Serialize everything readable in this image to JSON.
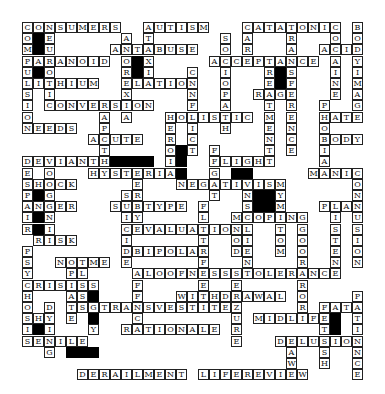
{
  "puzzle": {
    "type": "crossword",
    "cell_size": 11,
    "rows": 32,
    "cols": 31,
    "across": [
      {
        "word": "CONSUMERS",
        "row": 0,
        "col": 0
      },
      {
        "word": "AUTISM",
        "row": 0,
        "col": 11
      },
      {
        "word": "CATATONIC",
        "row": 0,
        "col": 20
      },
      {
        "word": "ANTABUSE",
        "row": 2,
        "col": 8
      },
      {
        "word": "ACID",
        "row": 2,
        "col": 27
      },
      {
        "word": "PARANOID",
        "row": 3,
        "col": 0
      },
      {
        "word": "ACCEPTANCE",
        "row": 3,
        "col": 17
      },
      {
        "word": "LITHIUM",
        "row": 5,
        "col": 0
      },
      {
        "word": "ELATION",
        "row": 5,
        "col": 9
      },
      {
        "word": "RAGE",
        "row": 6,
        "col": 21
      },
      {
        "word": "CONVERSION",
        "row": 7,
        "col": 2
      },
      {
        "word": "HOLISTIC",
        "row": 8,
        "col": 13
      },
      {
        "word": "HATE",
        "row": 8,
        "col": 27
      },
      {
        "word": "NEEDS",
        "row": 9,
        "col": 0
      },
      {
        "word": "ACUTE",
        "row": 10,
        "col": 6
      },
      {
        "word": "BODY",
        "row": 10,
        "col": 27
      },
      {
        "word": "DEVIANT",
        "row": 12,
        "col": 0
      },
      {
        "word": "FLIGHT",
        "row": 12,
        "col": 17
      },
      {
        "word": "HYSTERIA",
        "row": 13,
        "col": 6
      },
      {
        "word": "MANIC",
        "row": 13,
        "col": 26
      },
      {
        "word": "SHOCK",
        "row": 14,
        "col": 0
      },
      {
        "word": "NEGATIVISM",
        "row": 14,
        "col": 14
      },
      {
        "word": "PLAN",
        "row": 16,
        "col": 27
      },
      {
        "word": "ANGER",
        "row": 16,
        "col": 0
      },
      {
        "word": "SUBTYPE",
        "row": 16,
        "col": 8
      },
      {
        "word": "COPING",
        "row": 17,
        "col": 20
      },
      {
        "word": "EVALUATION",
        "row": 18,
        "col": 10
      },
      {
        "word": "RISK",
        "row": 19,
        "col": 1
      },
      {
        "word": "BIPOLAR",
        "row": 20,
        "col": 10
      },
      {
        "word": "NOTME",
        "row": 21,
        "col": 3
      },
      {
        "word": "ALOOFNESS",
        "row": 22,
        "col": 10
      },
      {
        "word": "TOLERANCE",
        "row": 22,
        "col": 20
      },
      {
        "word": "CRISIS",
        "row": 23,
        "col": 0
      },
      {
        "word": "WITHDRAWAL",
        "row": 24,
        "col": 14
      },
      {
        "word": "TRANSVESTITE",
        "row": 25,
        "col": 7
      },
      {
        "word": "FAT",
        "row": 25,
        "col": 27
      },
      {
        "word": "SHY",
        "row": 26,
        "col": 0
      },
      {
        "word": "MIDLIFE",
        "row": 26,
        "col": 21
      },
      {
        "word": "RATIONALE",
        "row": 27,
        "col": 9
      },
      {
        "word": "SENILE",
        "row": 28,
        "col": 0
      },
      {
        "word": "DELUSION",
        "row": 28,
        "col": 23
      },
      {
        "word": "DERAILMENT",
        "row": 31,
        "col": 5
      },
      {
        "word": "LIFEREVIEW",
        "row": 31,
        "col": 16
      }
    ],
    "down": [
      {
        "word": "COMPULSION",
        "row": 0,
        "col": 0
      },
      {
        "word": "NEUROTIC",
        "row": 0,
        "col": 2
      },
      {
        "word": "ANOREXIA",
        "row": 1,
        "col": 9
      },
      {
        "word": "ATAXIA",
        "row": 0,
        "col": 11
      },
      {
        "word": "SOCIOPATH",
        "row": 1,
        "col": 18
      },
      {
        "word": "CARE",
        "row": 0,
        "col": 20
      },
      {
        "word": "TRANSFERENCE",
        "row": 0,
        "col": 24
      },
      {
        "word": "TREATMENT",
        "row": 3,
        "col": 22
      },
      {
        "word": "COCAINE",
        "row": 0,
        "col": 28
      },
      {
        "word": "BODYIMAGE",
        "row": 0,
        "col": 30
      },
      {
        "word": "CONFLICT",
        "row": 4,
        "col": 15
      },
      {
        "word": "APATHY",
        "row": 8,
        "col": 7
      },
      {
        "word": "HEROIN",
        "row": 8,
        "col": 13
      },
      {
        "word": "PHOBIA",
        "row": 7,
        "col": 27
      },
      {
        "word": "DESPAIR",
        "row": 12,
        "col": 0
      },
      {
        "word": "ORGANIC",
        "row": 13,
        "col": 2
      },
      {
        "word": "ENERGY",
        "row": 12,
        "col": 10
      },
      {
        "word": "FIGHT",
        "row": 11,
        "col": 17
      },
      {
        "word": "GAINS",
        "row": 12,
        "col": 20
      },
      {
        "word": "SYMPTOM",
        "row": 14,
        "col": 23
      },
      {
        "word": "CONFUSION",
        "row": 13,
        "col": 30
      },
      {
        "word": "LISTEN",
        "row": 16,
        "col": 28
      },
      {
        "word": "EGO",
        "row": 17,
        "col": 25
      },
      {
        "word": "SUICIDE",
        "row": 15,
        "col": 9
      },
      {
        "word": "FLATAFFECT",
        "row": 16,
        "col": 16
      },
      {
        "word": "MOOD",
        "row": 17,
        "col": 19
      },
      {
        "word": "CLIENT",
        "row": 17,
        "col": 20
      },
      {
        "word": "SORORORO",
        "row": 19,
        "col": 25
      },
      {
        "word": "PSYCHOSIS",
        "row": 20,
        "col": 0
      },
      {
        "word": "OPIATE",
        "row": 21,
        "col": 4
      },
      {
        "word": "LOSS",
        "row": 22,
        "col": 5
      },
      {
        "word": "AFFECT",
        "row": 22,
        "col": 10
      },
      {
        "word": "SEIZURE",
        "row": 22,
        "col": 19
      },
      {
        "word": "PATIENCE",
        "row": 24,
        "col": 30
      },
      {
        "word": "DYING",
        "row": 25,
        "col": 2
      },
      {
        "word": "GAY",
        "row": 25,
        "col": 6
      },
      {
        "word": "FETISH",
        "row": 25,
        "col": 27
      },
      {
        "word": "SFEA",
        "row": 23,
        "col": 6
      },
      {
        "word": "RAW",
        "row": 28,
        "col": 24
      }
    ],
    "blocks": [
      [
        1,
        1
      ],
      [
        2,
        1
      ],
      [
        4,
        1
      ],
      [
        3,
        10
      ],
      [
        4,
        10
      ],
      [
        4,
        23
      ],
      [
        5,
        23
      ],
      [
        12,
        8
      ],
      [
        12,
        9
      ],
      [
        12,
        10
      ],
      [
        12,
        11
      ],
      [
        11,
        14
      ],
      [
        12,
        14
      ],
      [
        13,
        14
      ],
      [
        13,
        19
      ],
      [
        13,
        20
      ],
      [
        15,
        21
      ],
      [
        15,
        22
      ],
      [
        16,
        21
      ],
      [
        16,
        22
      ],
      [
        15,
        1
      ],
      [
        17,
        1
      ],
      [
        18,
        1
      ],
      [
        24,
        6
      ],
      [
        26,
        6
      ],
      [
        27,
        1
      ],
      [
        26,
        28
      ],
      [
        27,
        28
      ],
      [
        29,
        4
      ],
      [
        29,
        5
      ],
      [
        29,
        6
      ]
    ]
  }
}
